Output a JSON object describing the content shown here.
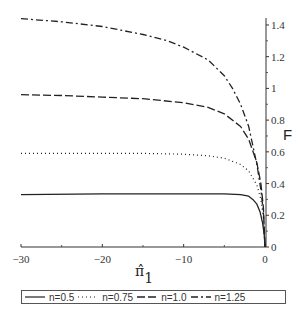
{
  "chart_data": {
    "type": "line",
    "title": "",
    "xlabel": "π̂₁",
    "ylabel": "F",
    "xlim": [
      -30,
      0
    ],
    "ylim": [
      0,
      1.45
    ],
    "x_ticks": [
      -30,
      -20,
      -10,
      0
    ],
    "x_tick_labels": [
      "−30",
      "−20",
      "−10",
      "0"
    ],
    "x_minor_ticks": [
      -25,
      -15,
      -5
    ],
    "y_ticks": [
      0,
      0.2,
      0.4,
      0.6,
      0.8,
      1,
      1.2,
      1.4
    ],
    "y_tick_labels": [
      "0",
      "0.2",
      "0.4",
      "0.6",
      "0.8",
      "1",
      "1.2",
      "1.4"
    ],
    "y_axis_position": "right",
    "grid": false,
    "legend_position": "bottom",
    "series": [
      {
        "name": "n=0.5",
        "style": "solid",
        "x": [
          -30,
          -20,
          -10,
          -5,
          -3,
          -2,
          -1.5,
          -1,
          -0.6,
          -0.3,
          -0.1,
          0
        ],
        "y": [
          0.33,
          0.335,
          0.335,
          0.335,
          0.33,
          0.32,
          0.3,
          0.27,
          0.22,
          0.15,
          0.08,
          0
        ]
      },
      {
        "name": "n=0.75",
        "style": "dotted",
        "x": [
          -30,
          -20,
          -15,
          -10,
          -7,
          -5,
          -3,
          -2,
          -1,
          -0.5,
          -0.2,
          0
        ],
        "y": [
          0.59,
          0.59,
          0.59,
          0.585,
          0.575,
          0.56,
          0.52,
          0.48,
          0.39,
          0.3,
          0.18,
          0
        ]
      },
      {
        "name": "n=1.0",
        "style": "dashed",
        "x": [
          -30,
          -25,
          -20,
          -15,
          -10,
          -7,
          -5,
          -3,
          -2,
          -1,
          -0.5,
          -0.2,
          0
        ],
        "y": [
          0.96,
          0.955,
          0.945,
          0.935,
          0.91,
          0.88,
          0.84,
          0.76,
          0.68,
          0.53,
          0.4,
          0.25,
          0
        ]
      },
      {
        "name": "n=1.25",
        "style": "dashdot",
        "x": [
          -30,
          -25,
          -20,
          -15,
          -12,
          -10,
          -7,
          -5,
          -4,
          -3,
          -2,
          -1,
          -0.5,
          -0.2,
          0
        ],
        "y": [
          1.44,
          1.42,
          1.39,
          1.34,
          1.3,
          1.26,
          1.18,
          1.08,
          1.0,
          0.9,
          0.76,
          0.52,
          0.36,
          0.22,
          0
        ]
      }
    ]
  },
  "legend": {
    "items": [
      {
        "label": "n=0.5"
      },
      {
        "label": "n=0.75"
      },
      {
        "label": "n=1.0"
      },
      {
        "label": "n=1.25"
      }
    ]
  },
  "colors": {
    "line": "#222222",
    "axis": "#333333"
  }
}
